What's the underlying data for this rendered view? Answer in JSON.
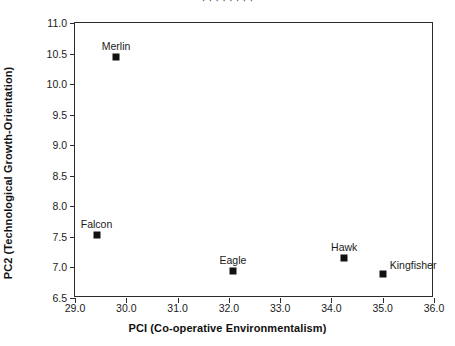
{
  "top_clipped_text": "·  ·   ·   ·   ·   ·        ·  ·",
  "chart_data": {
    "type": "scatter",
    "title": "",
    "xlabel": "PCI (Co-operative Environmentalism)",
    "ylabel": "PC2 (Technological Growth-Orientation)",
    "xlim": [
      29.0,
      36.0
    ],
    "ylim": [
      6.5,
      11.0
    ],
    "xticks": [
      "29.0",
      "30.0",
      "31.0",
      "32.0",
      "33.0",
      "34.0",
      "35.0",
      "36.0"
    ],
    "yticks": [
      "6.5",
      "7.0",
      "7.5",
      "8.0",
      "8.5",
      "9.0",
      "9.5",
      "10.0",
      "10.5",
      "11.0"
    ],
    "grid": false,
    "legend": "none",
    "marker": "filled-square",
    "marker_color": "#111111",
    "points": [
      {
        "label": "Merlin",
        "x": 29.8,
        "y": 10.45,
        "label_pos": "above"
      },
      {
        "label": "Falcon",
        "x": 29.42,
        "y": 7.53,
        "label_pos": "above"
      },
      {
        "label": "Eagle",
        "x": 32.08,
        "y": 6.95,
        "label_pos": "above"
      },
      {
        "label": "Hawk",
        "x": 34.25,
        "y": 7.15,
        "label_pos": "above"
      },
      {
        "label": "Kingfisher",
        "x": 35.0,
        "y": 6.9,
        "label_pos": "right"
      }
    ]
  }
}
